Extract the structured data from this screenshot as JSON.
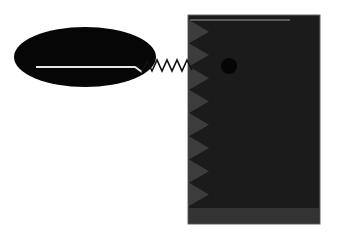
{
  "diagram": {
    "background": "#ffffff",
    "ellipse": {
      "cx": 85,
      "cy": 57,
      "rx": 71,
      "ry": 30,
      "fill": "#060606"
    },
    "line": {
      "color": "#e6e6e6",
      "points": "36,67 135,67 142,72"
    },
    "spring": {
      "color": "#111111",
      "points": "142,72 147,61 152,71 157,60 162,71 167,60 172,71 177,60 182,71 187,60 192,70"
    },
    "block": {
      "x": 188,
      "y": 15,
      "width": 132,
      "height": 209,
      "fill": "#1b1b1b",
      "stroke": "#666666"
    },
    "top_line": {
      "color": "#9a9a9a",
      "x1": 190,
      "x2": 290,
      "y": 20
    },
    "teeth": {
      "fill": "#3c3c3c",
      "count": 8,
      "x": 189,
      "y_start": 20,
      "y_end": 206,
      "depth": 20
    },
    "dot": {
      "cx": 229,
      "cy": 66,
      "r": 8,
      "fill": "#050505"
    },
    "bottom_band": {
      "x": 189,
      "y": 208,
      "width": 130,
      "height": 15,
      "fill": "#333333"
    }
  }
}
